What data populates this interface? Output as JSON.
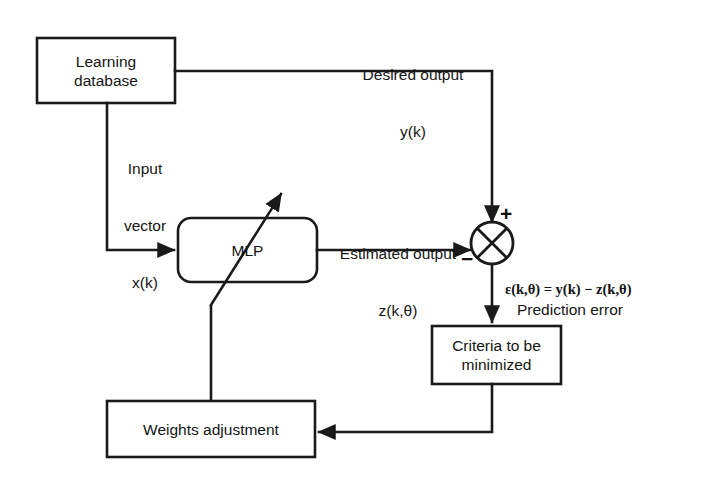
{
  "diagram": {
    "background_color": "#ffffff",
    "line_color": "#1a1a1a",
    "blocks": [
      {
        "id": "learning-database",
        "label": "Learning\ndatabase",
        "line1": "Learning",
        "line2": "database",
        "shape": "rectangle"
      },
      {
        "id": "mlp",
        "label": "MLP",
        "shape": "rounded-rectangle"
      },
      {
        "id": "criteria",
        "label": "Criteria to be\nminimized",
        "line1": "Criteria to be",
        "line2": "minimized",
        "shape": "rectangle"
      },
      {
        "id": "weights-adjustment",
        "label": "Weights adjustment",
        "shape": "rectangle"
      },
      {
        "id": "summing-junction",
        "label": "",
        "shape": "circle-with-cross"
      }
    ],
    "labels": {
      "desired_output_line1": "Desired output",
      "desired_output_line2": "y(k)",
      "input_vector_line1": "Input",
      "input_vector_line2": "vector",
      "input_vector_line3": "x(k)",
      "estimated_output_line1": "Estimated output",
      "estimated_output_line2": "z(k,θ)",
      "prediction_error_line1": "Prediction error",
      "prediction_error_equation": "ε(k,θ) = y(k) − z(k,θ)",
      "plus_sign": "+",
      "minus_sign": "−"
    }
  }
}
